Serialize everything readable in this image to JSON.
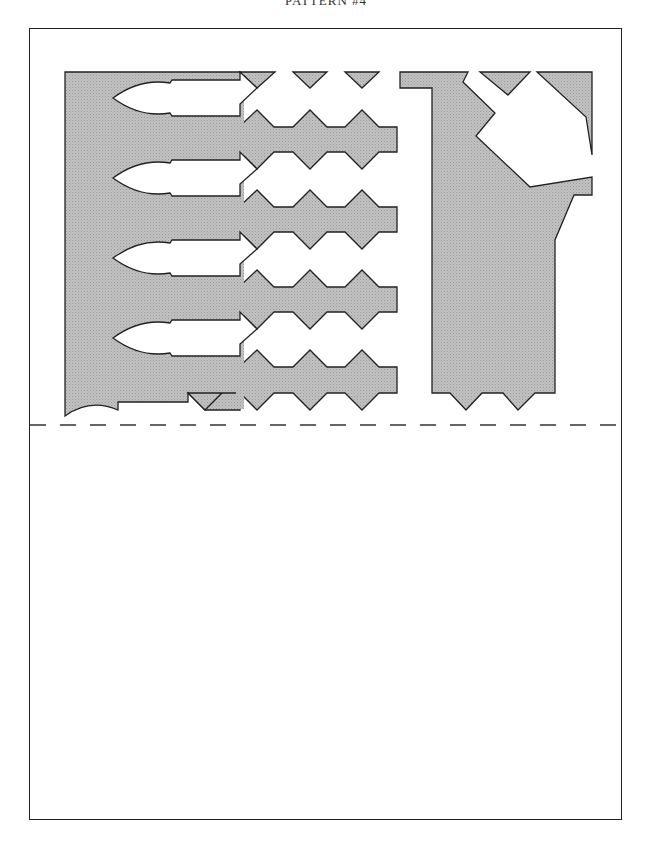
{
  "page": {
    "title": "PATTERN #4",
    "fill_color": "#b8b8b8",
    "stroke_color": "#222222",
    "fold_line": "dashed",
    "cut_rows": 4
  }
}
